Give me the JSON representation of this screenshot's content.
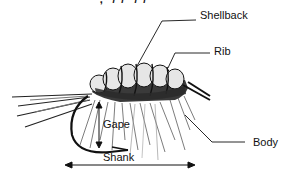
{
  "diagram": {
    "top_caption_fragment": "·, ·/·/··/·/·· ·",
    "labels": {
      "shellback": "Shellback",
      "rib": "Rib",
      "gape": "Gape",
      "body": "Body",
      "shank": "Shank"
    },
    "colors": {
      "ink": "#111111",
      "background": "#ffffff",
      "shell_fill": "#e8e8e8",
      "hackle_gray": "#555555"
    }
  }
}
